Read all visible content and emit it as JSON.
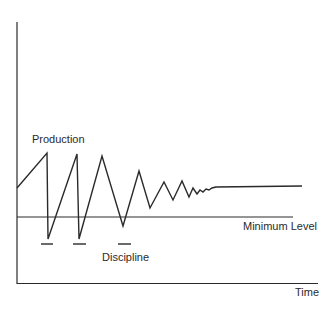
{
  "chart_data": {
    "type": "line",
    "title": "",
    "xlabel": "Time",
    "ylabel": "",
    "grid": false,
    "annotations": [
      "Production",
      "Minimum Level",
      "Discipline"
    ],
    "series": [
      {
        "name": "Production",
        "description": "Damped oscillating output: sawtooth drops below minimum level (met with discipline) and gradually stabilizes above the minimum level",
        "points_px": [
          [
            17,
            188
          ],
          [
            47,
            153
          ],
          [
            48,
            239
          ],
          [
            77,
            154
          ],
          [
            79,
            239
          ],
          [
            102,
            156
          ],
          [
            123,
            226
          ],
          [
            139,
            171
          ],
          [
            150,
            208
          ],
          [
            164,
            182
          ],
          [
            173,
            200
          ],
          [
            182,
            181
          ],
          [
            189,
            197
          ],
          [
            193,
            188
          ],
          [
            197,
            194
          ],
          [
            200,
            190
          ],
          [
            203,
            192
          ],
          [
            206,
            189
          ],
          [
            209,
            190
          ],
          [
            212,
            188
          ],
          [
            216,
            187
          ],
          [
            302,
            186
          ]
        ]
      },
      {
        "name": "Minimum Level",
        "points_px": [
          [
            17,
            217
          ],
          [
            293,
            217
          ]
        ]
      }
    ],
    "discipline_markers_px": [
      {
        "x1": 41,
        "x2": 53,
        "y": 244
      },
      {
        "x1": 73,
        "x2": 86,
        "y": 244
      },
      {
        "x1": 118,
        "x2": 131,
        "y": 244
      }
    ]
  },
  "labels": {
    "production": "Production",
    "minimum_level": "Minimum Level",
    "discipline": "Discipline",
    "time": "Time"
  },
  "colors": {
    "line": "#2a2a2a",
    "background": "#ffffff"
  }
}
